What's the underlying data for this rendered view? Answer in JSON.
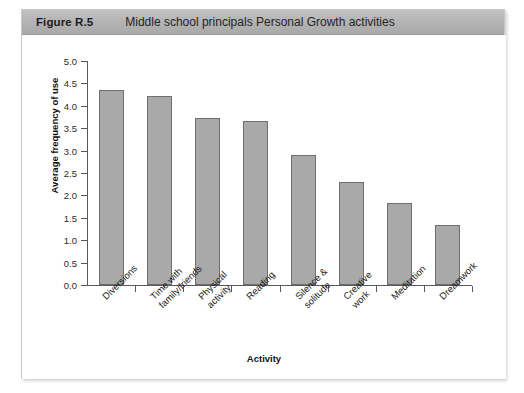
{
  "figure": {
    "number": "Figure R.5",
    "caption": "Middle school principals Personal Growth activities"
  },
  "chart_data": {
    "type": "bar",
    "title": "Middle school principals Personal Growth activities",
    "xlabel": "Activity",
    "ylabel": "Average frequency of use",
    "ylim": [
      0.0,
      5.0
    ],
    "ytick_step": 0.5,
    "grid": false,
    "legend": null,
    "bar_color": "#a9a9a9",
    "bar_edge_color": "#6f6f6f",
    "ytick_labels": [
      "0.0",
      "0.5",
      "1.0",
      "1.5",
      "2.0",
      "2.5",
      "3.0",
      "3.5",
      "4.0",
      "4.5",
      "5.0"
    ],
    "categories": [
      "Diversions",
      "Time with\nfamily/friends",
      "Physical\nactivity",
      "Reading",
      "Silence &\nsolitude",
      "Creative\nwork",
      "Meditation",
      "Dreamwork"
    ],
    "values": [
      4.35,
      4.22,
      3.72,
      3.66,
      2.91,
      2.3,
      1.82,
      1.33
    ]
  }
}
